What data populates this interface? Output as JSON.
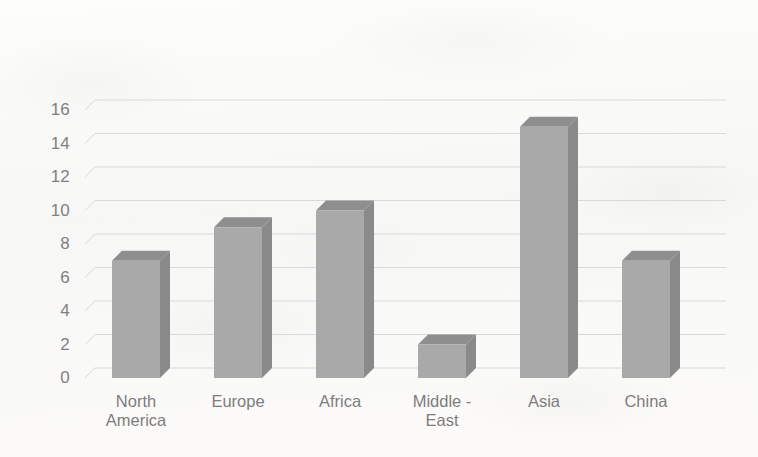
{
  "chart_data": {
    "type": "bar",
    "title": "",
    "subtitle": "",
    "xlabel": "",
    "ylabel": "",
    "style": "3d-column",
    "grid": true,
    "legend": false,
    "legend_position": "none",
    "ylim": [
      0,
      17
    ],
    "yticks": [
      "0",
      "2",
      "4",
      "6",
      "8",
      "10",
      "12",
      "14",
      "16"
    ],
    "ytick_values": [
      0,
      2,
      4,
      6,
      8,
      10,
      12,
      14,
      16
    ],
    "categories": [
      "North\nAmerica",
      "Europe",
      "Africa",
      "Middle -\nEast",
      "Asia",
      "China"
    ],
    "category_names": [
      "North America",
      "Europe",
      "Africa",
      "Middle - East",
      "Asia",
      "China"
    ],
    "values": [
      7,
      9,
      10,
      2,
      15,
      7
    ],
    "series": [
      {
        "name": "",
        "values": [
          7,
          9,
          10,
          2,
          15,
          7
        ]
      }
    ]
  },
  "colors": {
    "background": "#fbfbfa",
    "bar_front": "#a9a9a9",
    "bar_top": "#8e8e8e",
    "bar_side": "#8a8a8a",
    "gridline": "#d9d9d9",
    "tick_text": "#808080",
    "label_text": "#7d7d7d"
  }
}
